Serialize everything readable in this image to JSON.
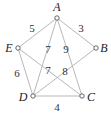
{
  "graph": {
    "nodes": [
      {
        "id": "A",
        "label": "A",
        "x": 57,
        "y": 18,
        "lx": 57,
        "ly": 11
      },
      {
        "id": "B",
        "label": "B",
        "x": 96,
        "y": 48,
        "lx": 104,
        "ly": 52
      },
      {
        "id": "C",
        "label": "C",
        "x": 82,
        "y": 96,
        "lx": 91,
        "ly": 101
      },
      {
        "id": "D",
        "label": "D",
        "x": 33,
        "y": 96,
        "lx": 23,
        "ly": 101
      },
      {
        "id": "E",
        "label": "E",
        "x": 18,
        "y": 48,
        "lx": 9,
        "ly": 52
      }
    ],
    "edges": [
      {
        "from": "A",
        "to": "E",
        "weight": "5",
        "lx": 32,
        "ly": 32
      },
      {
        "from": "A",
        "to": "B",
        "weight": "3",
        "lx": 81,
        "ly": 32
      },
      {
        "from": "A",
        "to": "D",
        "weight": "7",
        "lx": 48,
        "ly": 53
      },
      {
        "from": "A",
        "to": "C",
        "weight": "9",
        "lx": 66,
        "ly": 53
      },
      {
        "from": "E",
        "to": "C",
        "weight": "7",
        "lx": 48,
        "ly": 74
      },
      {
        "from": "B",
        "to": "D",
        "weight": "8",
        "lx": 65,
        "ly": 75
      },
      {
        "from": "E",
        "to": "D",
        "weight": "6",
        "lx": 17,
        "ly": 77
      },
      {
        "from": "D",
        "to": "C",
        "weight": "4",
        "lx": 57,
        "ly": 111
      }
    ]
  }
}
